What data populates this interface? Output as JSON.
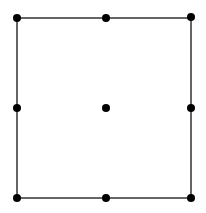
{
  "diagram": {
    "type": "grid-nodes-square",
    "colors": {
      "line": "#333333",
      "node": "#000000",
      "background": "#ffffff"
    },
    "frame": {
      "x1": 17,
      "y1": 18,
      "x2": 191,
      "y2": 198
    },
    "nodes": [
      {
        "id": "top-left",
        "x": 17,
        "y": 18
      },
      {
        "id": "top-middle",
        "x": 106,
        "y": 18
      },
      {
        "id": "top-right",
        "x": 191,
        "y": 17
      },
      {
        "id": "middle-left",
        "x": 17,
        "y": 108
      },
      {
        "id": "center",
        "x": 106,
        "y": 108
      },
      {
        "id": "middle-right",
        "x": 191,
        "y": 108
      },
      {
        "id": "bottom-left",
        "x": 17,
        "y": 198
      },
      {
        "id": "bottom-middle",
        "x": 106,
        "y": 198
      },
      {
        "id": "bottom-right",
        "x": 191,
        "y": 198
      }
    ],
    "node_radius": 4
  }
}
